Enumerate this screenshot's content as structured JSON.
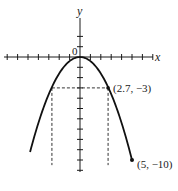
{
  "chart_data": {
    "type": "line",
    "title": "",
    "xlabel": "x",
    "ylabel": "y",
    "origin_label": "0",
    "function": "y = -0.4 x^2",
    "x_ticks_per_side": 7,
    "y_ticks_above": 2,
    "y_ticks_below": 11,
    "tick_unit": 1,
    "series": [
      {
        "name": "parabola",
        "x": [
          -5,
          -4,
          -3,
          -2.7,
          -2,
          -1,
          0,
          1,
          2,
          2.7,
          3,
          4,
          5
        ],
        "y": [
          -10,
          -6.4,
          -3.6,
          -3,
          -1.6,
          -0.4,
          0,
          -0.4,
          -1.6,
          -3,
          -3.6,
          -6.4,
          -10
        ]
      }
    ],
    "annotations": [
      {
        "label": "(2.7, −3)",
        "x": 2.7,
        "y": -3
      },
      {
        "label": "(5, −10)",
        "x": 5,
        "y": -10
      }
    ],
    "guides": [
      {
        "type": "dashed-horizontal",
        "y": -3,
        "x_from": -2.7,
        "x_to": 2.7
      },
      {
        "type": "dashed-vertical",
        "x": -2.7,
        "y_from": -3,
        "y_to": -10.5
      },
      {
        "type": "dashed-vertical",
        "x": 2.7,
        "y_from": -3,
        "y_to": -10.5
      }
    ],
    "xlim": [
      -7.5,
      7
    ],
    "ylim": [
      -11,
      4
    ],
    "grid": false,
    "legend": "none",
    "colors": {
      "curve": "#111111",
      "axes": "#1a1a1a",
      "guides": "#333333"
    }
  },
  "labels": {
    "x_axis": "x",
    "y_axis": "y",
    "origin": "0",
    "point_a": "(2.7, −3)",
    "point_b": "(5, −10)"
  }
}
